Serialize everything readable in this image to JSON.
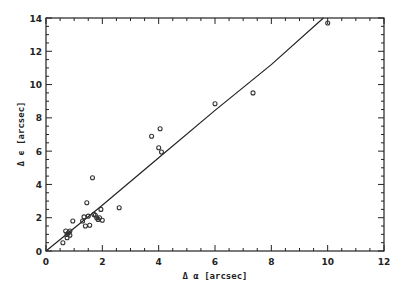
{
  "chart_data": {
    "type": "scatter",
    "title": "",
    "xlabel": "Δ α [arcsec]",
    "ylabel": "Δ ϵ [arcsec]",
    "xlim": [
      0,
      12
    ],
    "ylim": [
      0,
      14
    ],
    "x_ticks": [
      0,
      2,
      4,
      6,
      8,
      10,
      12
    ],
    "y_ticks": [
      0,
      2,
      4,
      6,
      8,
      10,
      12,
      14
    ],
    "grid": false,
    "legend": null,
    "series": [
      {
        "name": "data",
        "marker": "open-circle",
        "points": [
          [
            0.6,
            0.5
          ],
          [
            0.7,
            1.2
          ],
          [
            0.75,
            1.0
          ],
          [
            0.75,
            0.8
          ],
          [
            0.8,
            1.1
          ],
          [
            0.85,
            0.95
          ],
          [
            0.85,
            1.2
          ],
          [
            0.95,
            1.8
          ],
          [
            1.3,
            1.8
          ],
          [
            1.35,
            2.05
          ],
          [
            1.4,
            1.5
          ],
          [
            1.45,
            2.9
          ],
          [
            1.5,
            2.1
          ],
          [
            1.55,
            1.55
          ],
          [
            1.65,
            4.4
          ],
          [
            1.7,
            2.2
          ],
          [
            1.75,
            2.15
          ],
          [
            1.8,
            2.0
          ],
          [
            1.85,
            1.9
          ],
          [
            1.9,
            2.0
          ],
          [
            1.95,
            2.5
          ],
          [
            2.0,
            1.85
          ],
          [
            2.6,
            2.6
          ],
          [
            3.75,
            6.9
          ],
          [
            4.0,
            6.2
          ],
          [
            4.05,
            7.35
          ],
          [
            4.1,
            5.95
          ],
          [
            6.0,
            8.85
          ],
          [
            7.35,
            9.5
          ],
          [
            10.0,
            13.7
          ]
        ]
      },
      {
        "name": "fit",
        "type": "line",
        "points": [
          [
            0,
            0
          ],
          [
            2,
            2.75
          ],
          [
            4,
            5.6
          ],
          [
            6,
            8.45
          ],
          [
            8,
            11.2
          ],
          [
            9.85,
            14.0
          ]
        ]
      }
    ]
  },
  "axes": {
    "xlabel": "Δ α [arcsec]",
    "ylabel": "Δ ϵ [arcsec]"
  }
}
